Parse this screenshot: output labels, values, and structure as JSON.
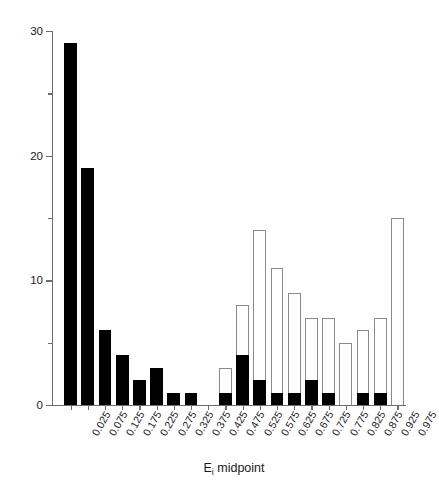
{
  "chart_data": {
    "type": "bar",
    "title": "",
    "xlabel": "Ei midpoint",
    "xlabel_base": "E",
    "xlabel_sub": "i",
    "xlabel_rest": " midpoint",
    "ylabel": "Frequency",
    "ylim": [
      0,
      30
    ],
    "ytick_major": [
      0,
      10,
      20,
      30
    ],
    "ytick_minor": [
      5,
      15,
      25
    ],
    "grid": false,
    "legend": null,
    "stacked": true,
    "categories": [
      "0.025",
      "0.075",
      "0.125",
      "0.175",
      "0.225",
      "0.275",
      "0.325",
      "0.375",
      "0.425",
      "0.475",
      "0.525",
      "0.575",
      "0.625",
      "0.675",
      "0.725",
      "0.775",
      "0.825",
      "0.875",
      "0.925",
      "0.975"
    ],
    "series": [
      {
        "name": "filled",
        "color": "#000000",
        "values": [
          29,
          19,
          6,
          4,
          2,
          3,
          1,
          1,
          0,
          1,
          4,
          2,
          1,
          1,
          2,
          1,
          0,
          1,
          1,
          0
        ]
      },
      {
        "name": "open",
        "color": "#ffffff",
        "values": [
          0,
          0,
          0,
          0,
          0,
          0,
          0,
          0,
          0,
          2,
          4,
          12,
          10,
          8,
          5,
          6,
          5,
          5,
          6,
          15
        ]
      }
    ],
    "totals": [
      29,
      19,
      6,
      4,
      2,
      3,
      1,
      1,
      0,
      3,
      8,
      14,
      11,
      9,
      7,
      7,
      5,
      6,
      7,
      15
    ]
  }
}
